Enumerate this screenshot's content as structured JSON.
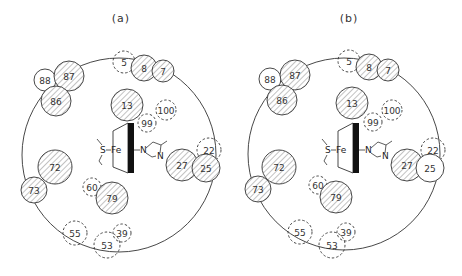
{
  "figure": {
    "panels": [
      {
        "id": "a",
        "title": "(a)",
        "title_pos": [
          121,
          22
        ],
        "boundary": {
          "cx": 119,
          "cy": 155,
          "r": 97
        },
        "heme": {
          "x": 115,
          "y": 123
        },
        "residues": [
          {
            "label": "88",
            "cx": 45,
            "cy": 80,
            "r": 11,
            "style": "plain"
          },
          {
            "label": "87",
            "cx": 69,
            "cy": 76,
            "r": 15,
            "style": "hatched"
          },
          {
            "label": "86",
            "cx": 56,
            "cy": 101,
            "r": 15,
            "style": "hatched"
          },
          {
            "label": "5",
            "cx": 124,
            "cy": 62,
            "r": 11,
            "style": "dashed"
          },
          {
            "label": "8",
            "cx": 144,
            "cy": 68,
            "r": 13,
            "style": "hatched"
          },
          {
            "label": "7",
            "cx": 163,
            "cy": 71,
            "r": 11,
            "style": "hatched"
          },
          {
            "label": "13",
            "cx": 127,
            "cy": 105,
            "r": 16,
            "style": "hatched"
          },
          {
            "label": "99",
            "cx": 147,
            "cy": 123,
            "r": 9,
            "style": "dashed"
          },
          {
            "label": "100",
            "cx": 166,
            "cy": 110,
            "r": 10,
            "style": "dashed"
          },
          {
            "label": "22",
            "cx": 209,
            "cy": 150,
            "r": 12,
            "style": "dashed"
          },
          {
            "label": "27",
            "cx": 182,
            "cy": 165,
            "r": 16,
            "style": "hatched"
          },
          {
            "label": "25",
            "cx": 206,
            "cy": 168,
            "r": 14,
            "style": "hatched"
          },
          {
            "label": "72",
            "cx": 55,
            "cy": 167,
            "r": 17,
            "style": "hatched"
          },
          {
            "label": "73",
            "cx": 34,
            "cy": 190,
            "r": 13,
            "style": "hatched"
          },
          {
            "label": "60",
            "cx": 92,
            "cy": 187,
            "r": 9,
            "style": "dashed"
          },
          {
            "label": "79",
            "cx": 112,
            "cy": 198,
            "r": 16,
            "style": "hatched"
          },
          {
            "label": "55",
            "cx": 75,
            "cy": 233,
            "r": 12,
            "style": "dashed"
          },
          {
            "label": "39",
            "cx": 122,
            "cy": 233,
            "r": 9,
            "style": "dashed"
          },
          {
            "label": "53",
            "cx": 107,
            "cy": 245,
            "r": 13,
            "style": "dashed"
          }
        ]
      },
      {
        "id": "b",
        "title": "(b)",
        "title_pos": [
          349,
          22
        ],
        "boundary": {
          "cx": 344,
          "cy": 154,
          "r": 96
        },
        "heme": {
          "x": 340,
          "y": 123
        },
        "residues": [
          {
            "label": "88",
            "cx": 270,
            "cy": 79,
            "r": 11,
            "style": "plain"
          },
          {
            "label": "87",
            "cx": 295,
            "cy": 75,
            "r": 15,
            "style": "hatched"
          },
          {
            "label": "86",
            "cx": 282,
            "cy": 100,
            "r": 15,
            "style": "hatched"
          },
          {
            "label": "5",
            "cx": 349,
            "cy": 61,
            "r": 11,
            "style": "dashed"
          },
          {
            "label": "8",
            "cx": 369,
            "cy": 67,
            "r": 13,
            "style": "hatched"
          },
          {
            "label": "7",
            "cx": 388,
            "cy": 70,
            "r": 11,
            "style": "hatched"
          },
          {
            "label": "13",
            "cx": 352,
            "cy": 103,
            "r": 16,
            "style": "hatched"
          },
          {
            "label": "99",
            "cx": 373,
            "cy": 122,
            "r": 9,
            "style": "dashed"
          },
          {
            "label": "100",
            "cx": 392,
            "cy": 110,
            "r": 10,
            "style": "dashed"
          },
          {
            "label": "22",
            "cx": 433,
            "cy": 150,
            "r": 12,
            "style": "dashed"
          },
          {
            "label": "27",
            "cx": 407,
            "cy": 165,
            "r": 16,
            "style": "hatched"
          },
          {
            "label": "25",
            "cx": 430,
            "cy": 168,
            "r": 14,
            "style": "plain"
          },
          {
            "label": "72",
            "cx": 279,
            "cy": 167,
            "r": 17,
            "style": "hatched"
          },
          {
            "label": "73",
            "cx": 258,
            "cy": 189,
            "r": 13,
            "style": "hatched"
          },
          {
            "label": "60",
            "cx": 318,
            "cy": 185,
            "r": 9,
            "style": "dashed"
          },
          {
            "label": "79",
            "cx": 336,
            "cy": 197,
            "r": 16,
            "style": "hatched"
          },
          {
            "label": "55",
            "cx": 300,
            "cy": 232,
            "r": 12,
            "style": "dashed"
          },
          {
            "label": "39",
            "cx": 346,
            "cy": 232,
            "r": 9,
            "style": "dashed"
          },
          {
            "label": "53",
            "cx": 332,
            "cy": 245,
            "r": 13,
            "style": "dashed"
          }
        ]
      }
    ],
    "heme_labels": {
      "sulfur": "S",
      "iron": "Fe",
      "nitrogen1": "N",
      "nitrogen2": "N"
    },
    "colors": {
      "line": "#333333",
      "hatch": "#555555",
      "background": "#ffffff",
      "heme_bar": "#111111"
    }
  }
}
